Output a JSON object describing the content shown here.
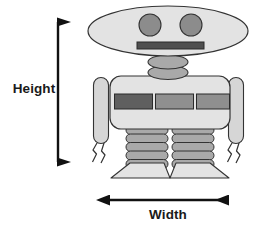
{
  "figure": {
    "type": "labeled-diagram",
    "background_color": "#ffffff",
    "annotations": [
      {
        "id": "height",
        "label": "Height",
        "orientation": "vertical",
        "arrow_style": "double-headed",
        "color": "#111111"
      },
      {
        "id": "width",
        "label": "Width",
        "orientation": "horizontal",
        "arrow_style": "double-headed",
        "color": "#111111"
      }
    ]
  },
  "robot": {
    "palette": {
      "body_fill": "#e3e3e3",
      "limb_fill": "#d6d6d6",
      "segment_fill": "#a9a9a9",
      "accent_fill": "#8c8c8c",
      "dark_panel": "#5f5f5f",
      "mid_panel": "#8f8f8f",
      "mouth_fill": "#4f4f4f",
      "outline": "#333333"
    },
    "parts": [
      {
        "name": "head",
        "shape": "ellipse",
        "count": 1
      },
      {
        "name": "eye",
        "shape": "circle",
        "count": 2
      },
      {
        "name": "mouth",
        "shape": "rectangle",
        "count": 1
      },
      {
        "name": "neck-disc",
        "shape": "ellipse",
        "count": 2
      },
      {
        "name": "torso",
        "shape": "rounded-rectangle",
        "count": 1
      },
      {
        "name": "chest-panel",
        "shape": "rectangle",
        "count": 3
      },
      {
        "name": "arm",
        "shape": "capsule",
        "count": 2
      },
      {
        "name": "claw",
        "shape": "pincer",
        "count": 2
      },
      {
        "name": "leg-segment",
        "shape": "rounded-bar",
        "count": 10
      },
      {
        "name": "foot",
        "shape": "trapezoid",
        "count": 2
      }
    ]
  }
}
